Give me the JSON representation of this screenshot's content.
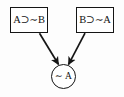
{
  "figure": {
    "type": "logic-inference-diagram",
    "background_color": "#ffffff",
    "ink_color": "#151515"
  },
  "premises": [
    {
      "id": "premise-left",
      "label": "A⊃∼B",
      "position": "top-left"
    },
    {
      "id": "premise-right",
      "label": "B⊃∼A",
      "position": "top-right"
    }
  ],
  "conclusion": {
    "id": "conclusion",
    "label": "∼ A",
    "shape": "circle",
    "position": "bottom-center"
  },
  "arrows": [
    {
      "id": "arrow-left-to-conclusion",
      "from": "premise-left",
      "to": "conclusion",
      "direction": "down-right"
    },
    {
      "id": "arrow-right-to-conclusion",
      "from": "premise-right",
      "to": "conclusion",
      "direction": "down-left"
    }
  ]
}
